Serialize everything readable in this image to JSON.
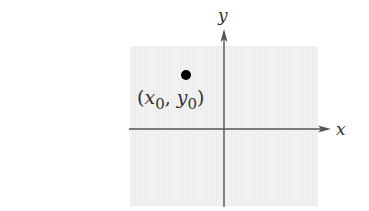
{
  "diagram": {
    "type": "coordinate-plane",
    "background_color": "#f0f0f0",
    "axis_color": "#555555",
    "point_color": "#000000",
    "axes": {
      "x": {
        "label": "x"
      },
      "y": {
        "label": "y"
      }
    },
    "point": {
      "label_open": "(",
      "x_var": "x",
      "x_sub": "0",
      "separator": ", ",
      "y_var": "y",
      "y_sub": "0",
      "label_close": ")",
      "quadrant": "II"
    }
  }
}
